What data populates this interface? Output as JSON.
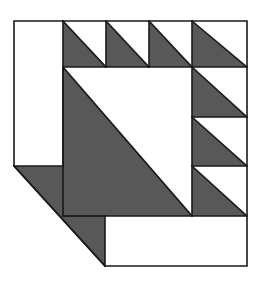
{
  "figure": {
    "name": "quilt-block-pattern",
    "width": 261,
    "height": 286,
    "background_color": "#ffffff",
    "shade_color": "#585858",
    "light_color": "#ffffff",
    "outline_color": "#1a1a1a",
    "outline_width": 1.6
  },
  "geometry": {
    "left": 14,
    "right": 247,
    "top": 21,
    "bottom": 266,
    "center_left": 63,
    "center_right": 192,
    "center_top": 67,
    "center_bottom": 216,
    "top_row_divisions": [
      63,
      106,
      149,
      192,
      247
    ],
    "right_col_divisions": [
      67,
      117,
      166,
      216
    ],
    "bevel_start_x": 14,
    "bevel_start_y": 166,
    "bevel_end_x": 105,
    "bevel_end_y": 266
  },
  "shapes": [
    {
      "id": "left-white-panel",
      "label": "Left White Panel",
      "fill": "light",
      "points": "14,21 63,21 63,166 14,166"
    },
    {
      "id": "top-triangle-1",
      "label": "Top Half-Square Triangle 1",
      "fill": "shade",
      "points": "63,21 106,67 63,67"
    },
    {
      "id": "top-triangle-1-light",
      "label": "Top Half-Square Triangle 1 Light",
      "fill": "light",
      "points": "63,21 106,21 106,67"
    },
    {
      "id": "top-triangle-2",
      "label": "Top Half-Square Triangle 2",
      "fill": "shade",
      "points": "106,21 149,67 106,67"
    },
    {
      "id": "top-triangle-2-light",
      "label": "Top Half-Square Triangle 2 Light",
      "fill": "light",
      "points": "106,21 149,21 149,67"
    },
    {
      "id": "top-triangle-3",
      "label": "Top Half-Square Triangle 3",
      "fill": "shade",
      "points": "149,21 192,67 149,67"
    },
    {
      "id": "top-triangle-3-light",
      "label": "Top Half-Square Triangle 3 Light",
      "fill": "light",
      "points": "149,21 192,21 192,67"
    },
    {
      "id": "top-triangle-4",
      "label": "Top Half-Square Triangle 4",
      "fill": "shade",
      "points": "192,21 247,67 192,67"
    },
    {
      "id": "top-triangle-4-light",
      "label": "Top Half-Square Triangle 4 Light",
      "fill": "light",
      "points": "192,21 247,21 247,67"
    },
    {
      "id": "center-square-shade",
      "label": "Center Large Triangle Shaded",
      "fill": "shade",
      "points": "63,67 192,216 63,216"
    },
    {
      "id": "center-square-light",
      "label": "Center Large Triangle Light",
      "fill": "light",
      "points": "63,67 192,67 192,216"
    },
    {
      "id": "right-triangle-1",
      "label": "Right Half-Square Triangle 1",
      "fill": "shade",
      "points": "192,67 247,117 192,117"
    },
    {
      "id": "right-triangle-1-light",
      "label": "Right Half-Square Triangle 1 Light",
      "fill": "light",
      "points": "192,67 247,67 247,117"
    },
    {
      "id": "right-triangle-2",
      "label": "Right Half-Square Triangle 2",
      "fill": "shade",
      "points": "192,117 247,166 192,166"
    },
    {
      "id": "right-triangle-2-light",
      "label": "Right Half-Square Triangle 2 Light",
      "fill": "light",
      "points": "192,117 247,117 247,166"
    },
    {
      "id": "right-triangle-3",
      "label": "Right Half-Square Triangle 3",
      "fill": "shade",
      "points": "192,166 247,216 192,216"
    },
    {
      "id": "right-triangle-3-light",
      "label": "Right Half-Square Triangle 3 Light",
      "fill": "light",
      "points": "192,166 247,166 247,216"
    },
    {
      "id": "bevel-wedge",
      "label": "Lower Left Bevel Wedge",
      "fill": "shade",
      "points": "14,166 105,266 105,216 63,216 63,166"
    },
    {
      "id": "bottom-white-bar",
      "label": "Bottom White Bar",
      "fill": "light",
      "points": "105,216 247,216 247,266 105,266"
    }
  ],
  "outline_paths": [
    {
      "id": "outer-border",
      "label": "Outer Border",
      "d": "M14,21 L247,21 L247,266 L105,266 L14,166 Z"
    },
    {
      "id": "center-square-border",
      "label": "Center Square Border",
      "d": "M63,67 L192,67 L192,216 L63,216 Z"
    },
    {
      "id": "left-panel-border",
      "label": "Left Panel Border",
      "d": "M63,21 L63,166 L14,166"
    },
    {
      "id": "top-row-baseline",
      "label": "Top Row Baseline",
      "d": "M192,67 L247,67"
    },
    {
      "id": "top-div-1",
      "label": "Top Division 1",
      "d": "M106,21 L106,67"
    },
    {
      "id": "top-div-2",
      "label": "Top Division 2",
      "d": "M149,21 L149,67"
    },
    {
      "id": "top-div-3",
      "label": "Top Division 3",
      "d": "M192,21 L192,67"
    },
    {
      "id": "right-div-1",
      "label": "Right Division 1",
      "d": "M192,117 L247,117"
    },
    {
      "id": "right-div-2",
      "label": "Right Division 2",
      "d": "M192,166 L247,166"
    },
    {
      "id": "right-div-3",
      "label": "Right Division 3",
      "d": "M192,216 L247,216"
    },
    {
      "id": "bottom-bar-top",
      "label": "Bottom Bar Top Edge",
      "d": "M105,216 L105,266"
    },
    {
      "id": "center-diagonal",
      "label": "Center Diagonal",
      "d": "M63,67 L192,216"
    },
    {
      "id": "top-diag-1",
      "label": "Top Diagonal 1",
      "d": "M63,21 L106,67"
    },
    {
      "id": "top-diag-2",
      "label": "Top Diagonal 2",
      "d": "M106,21 L149,67"
    },
    {
      "id": "top-diag-3",
      "label": "Top Diagonal 3",
      "d": "M149,21 L192,67"
    },
    {
      "id": "top-diag-4",
      "label": "Top Diagonal 4",
      "d": "M192,21 L247,67"
    },
    {
      "id": "right-diag-1",
      "label": "Right Diagonal 1",
      "d": "M192,67 L247,117"
    },
    {
      "id": "right-diag-2",
      "label": "Right Diagonal 2",
      "d": "M192,117 L247,166"
    },
    {
      "id": "right-diag-3",
      "label": "Right Diagonal 3",
      "d": "M192,166 L247,216"
    },
    {
      "id": "bevel-diagonal",
      "label": "Bevel Diagonal",
      "d": "M14,166 L105,266"
    },
    {
      "id": "bevel-inner-edge",
      "label": "Bevel Inner Edge",
      "d": "M63,216 L105,216"
    }
  ]
}
